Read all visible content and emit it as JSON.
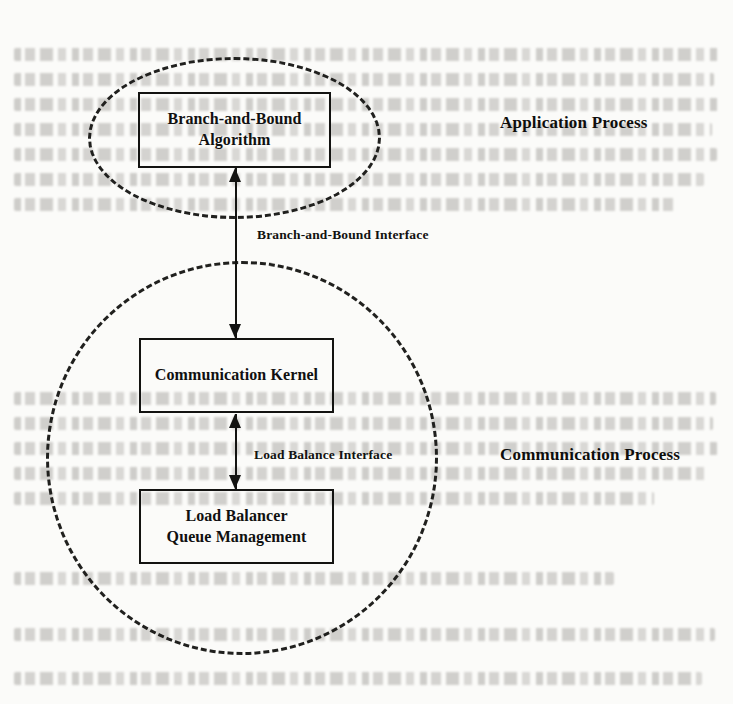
{
  "figure": {
    "kind": "block-diagram",
    "background_color": "#fbfbf9",
    "ink_color": "#131311"
  },
  "regions": [
    {
      "id": "application",
      "label": "Application Process",
      "shape": "dashed-ellipse"
    },
    {
      "id": "communication",
      "label": "Communication Process",
      "shape": "dashed-circle"
    }
  ],
  "boxes": {
    "branch_and_bound": {
      "line1": "Branch-and-Bound",
      "line2": "Algorithm"
    },
    "communication_kernel": {
      "line1": "Communication Kernel"
    },
    "load_balancer": {
      "line1": "Load Balancer",
      "line2": "Queue Management"
    }
  },
  "interfaces": {
    "branch_and_bound": "Branch-and-Bound Interface",
    "load_balance": "Load Balance Interface"
  },
  "connectors": [
    {
      "id": "bb-to-ck",
      "from": "branch_and_bound",
      "to": "communication_kernel",
      "direction": "bidirectional",
      "label": "Branch-and-Bound Interface"
    },
    {
      "id": "ck-to-lb",
      "from": "communication_kernel",
      "to": "load_balancer",
      "direction": "bidirectional",
      "label": "Load Balance Interface"
    }
  ]
}
